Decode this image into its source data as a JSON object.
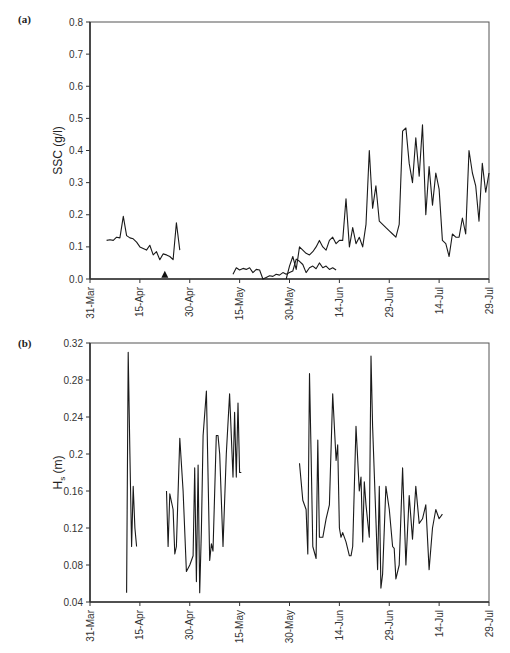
{
  "chart_data": [
    {
      "panel": "(a)",
      "type": "line",
      "title": "",
      "xlabel": "",
      "ylabel": "SSC (g/l)",
      "ylim": [
        0.0,
        0.8
      ],
      "yticks": [
        "0.0",
        "0.1",
        "0.2",
        "0.3",
        "0.4",
        "0.5",
        "0.6",
        "0.7",
        "0.8"
      ],
      "xticks": [
        "31-Mar",
        "15-Apr",
        "30-Apr",
        "15-May",
        "30-May",
        "14-Jun",
        "29-Jun",
        "14-Jul",
        "29-Jul"
      ],
      "x_unit": "days since 31-Mar",
      "xlim": [
        0,
        120
      ],
      "grid": false,
      "legend": null,
      "annotations": [
        {
          "type": "triangle-marker",
          "x": 22.5,
          "y": 0.01
        }
      ],
      "series": [
        {
          "name": "SSC",
          "segments": [
            [
              [
                5,
                0.12
              ],
              [
                6,
                0.122
              ],
              [
                7,
                0.12
              ],
              [
                8,
                0.13
              ],
              [
                9,
                0.128
              ],
              [
                10,
                0.195
              ],
              [
                11,
                0.135
              ],
              [
                12,
                0.128
              ],
              [
                13,
                0.125
              ],
              [
                14,
                0.115
              ],
              [
                15,
                0.1
              ],
              [
                16,
                0.095
              ],
              [
                17,
                0.09
              ],
              [
                18,
                0.105
              ],
              [
                19,
                0.075
              ],
              [
                20,
                0.085
              ],
              [
                21,
                0.06
              ],
              [
                22,
                0.078
              ],
              [
                23,
                0.075
              ],
              [
                24,
                0.07
              ],
              [
                25,
                0.06
              ],
              [
                26,
                0.175
              ],
              [
                27,
                0.09
              ]
            ],
            [
              [
                43,
                0.015
              ],
              [
                44,
                0.035
              ],
              [
                45,
                0.028
              ],
              [
                46,
                0.033
              ],
              [
                47,
                0.03
              ],
              [
                48,
                0.035
              ],
              [
                49,
                0.02
              ],
              [
                50,
                0.03
              ],
              [
                51,
                0.028
              ],
              [
                52,
                0.0
              ],
              [
                53,
                0.005
              ],
              [
                54,
                0.01
              ],
              [
                55,
                0.008
              ],
              [
                56,
                0.015
              ],
              [
                57,
                0.012
              ],
              [
                58,
                0.02
              ],
              [
                59,
                0.015
              ],
              [
                60,
                0.02
              ],
              [
                61,
                0.025
              ],
              [
                62,
                0.062
              ],
              [
                63,
                0.055
              ],
              [
                64,
                0.045
              ],
              [
                65,
                0.02
              ],
              [
                66,
                0.035
              ],
              [
                67,
                0.04
              ],
              [
                68,
                0.032
              ],
              [
                69,
                0.05
              ],
              [
                70,
                0.035
              ],
              [
                71,
                0.04
              ],
              [
                72,
                0.03
              ],
              [
                73,
                0.035
              ],
              [
                74,
                0.028
              ]
            ],
            [
              [
                59,
                0.0
              ],
              [
                60,
                0.04
              ],
              [
                61,
                0.07
              ],
              [
                62,
                0.03
              ],
              [
                63,
                0.1
              ],
              [
                64,
                0.09
              ],
              [
                65,
                0.08
              ],
              [
                66,
                0.075
              ],
              [
                67,
                0.085
              ],
              [
                68,
                0.1
              ],
              [
                69,
                0.12
              ],
              [
                70,
                0.1
              ],
              [
                71,
                0.09
              ],
              [
                72,
                0.12
              ],
              [
                73,
                0.13
              ],
              [
                74,
                0.11
              ],
              [
                75,
                0.12
              ],
              [
                76,
                0.12
              ],
              [
                77,
                0.25
              ],
              [
                78,
                0.1
              ],
              [
                79,
                0.16
              ],
              [
                80,
                0.11
              ],
              [
                81,
                0.13
              ],
              [
                82,
                0.1
              ],
              [
                83,
                0.17
              ],
              [
                84,
                0.4
              ],
              [
                85,
                0.22
              ],
              [
                86,
                0.29
              ],
              [
                87,
                0.18
              ],
              [
                88,
                0.17
              ],
              [
                89,
                0.16
              ],
              [
                90,
                0.15
              ],
              [
                91,
                0.14
              ],
              [
                92,
                0.13
              ],
              [
                93,
                0.17
              ],
              [
                94,
                0.46
              ],
              [
                95,
                0.47
              ],
              [
                96,
                0.36
              ],
              [
                97,
                0.3
              ],
              [
                98,
                0.44
              ],
              [
                99,
                0.32
              ],
              [
                100,
                0.48
              ],
              [
                101,
                0.2
              ],
              [
                102,
                0.35
              ],
              [
                103,
                0.23
              ],
              [
                104,
                0.33
              ],
              [
                105,
                0.28
              ],
              [
                106,
                0.12
              ],
              [
                107,
                0.11
              ],
              [
                108,
                0.07
              ],
              [
                109,
                0.14
              ],
              [
                110,
                0.13
              ],
              [
                111,
                0.13
              ],
              [
                112,
                0.19
              ],
              [
                113,
                0.14
              ],
              [
                114,
                0.4
              ],
              [
                115,
                0.33
              ],
              [
                116,
                0.29
              ],
              [
                117,
                0.18
              ],
              [
                118,
                0.36
              ],
              [
                119,
                0.27
              ],
              [
                120,
                0.33
              ]
            ]
          ]
        }
      ]
    },
    {
      "panel": "(b)",
      "type": "line",
      "title": "",
      "xlabel": "",
      "ylabel": "Hs (m)",
      "ylabel_main": "H",
      "ylabel_sub": "s",
      "ylabel_unit": " (m)",
      "ylim": [
        0.04,
        0.32
      ],
      "yticks": [
        "0.04",
        "0.08",
        "0.12",
        "0.16",
        "0.2",
        "0.24",
        "0.28",
        "0.32"
      ],
      "xticks": [
        "31-Mar",
        "15-Apr",
        "30-Apr",
        "15-May",
        "30-May",
        "14-Jun",
        "29-Jun",
        "14-Jul",
        "29-Jul"
      ],
      "x_unit": "days since 31-Mar",
      "xlim": [
        0,
        120
      ],
      "grid": false,
      "legend": null,
      "series": [
        {
          "name": "Hs",
          "segments": [
            [
              [
                11,
                0.05
              ],
              [
                11.5,
                0.31
              ],
              [
                12,
                0.2
              ],
              [
                12.5,
                0.1
              ],
              [
                13,
                0.165
              ],
              [
                13.5,
                0.12
              ],
              [
                14,
                0.1
              ]
            ],
            [
              [
                23,
                0.16
              ],
              [
                23.5,
                0.1
              ],
              [
                24,
                0.157
              ],
              [
                25,
                0.14
              ],
              [
                25.5,
                0.092
              ],
              [
                26,
                0.1
              ],
              [
                27,
                0.217
              ],
              [
                28,
                0.16
              ],
              [
                29,
                0.073
              ],
              [
                30,
                0.08
              ],
              [
                31,
                0.09
              ],
              [
                31.5,
                0.185
              ],
              [
                32,
                0.062
              ],
              [
                32.5,
                0.188
              ],
              [
                33,
                0.05
              ],
              [
                33.5,
                0.118
              ],
              [
                34,
                0.22
              ],
              [
                35,
                0.268
              ],
              [
                36,
                0.085
              ],
              [
                36.5,
                0.103
              ],
              [
                37,
                0.095
              ],
              [
                38,
                0.22
              ],
              [
                38.5,
                0.22
              ],
              [
                39,
                0.2
              ],
              [
                40,
                0.1
              ],
              [
                41,
                0.2
              ],
              [
                42,
                0.265
              ],
              [
                43,
                0.175
              ],
              [
                43.5,
                0.245
              ],
              [
                44,
                0.175
              ],
              [
                44.5,
                0.255
              ],
              [
                45,
                0.18
              ],
              [
                45.5,
                0.18
              ]
            ],
            [
              [
                63,
                0.19
              ],
              [
                64,
                0.15
              ],
              [
                65,
                0.14
              ],
              [
                65.5,
                0.092
              ],
              [
                66,
                0.287
              ],
              [
                66.5,
                0.2
              ],
              [
                67,
                0.1
              ],
              [
                68,
                0.087
              ],
              [
                68.5,
                0.215
              ],
              [
                69,
                0.11
              ],
              [
                70,
                0.11
              ],
              [
                71,
                0.13
              ],
              [
                72,
                0.145
              ],
              [
                73,
                0.265
              ],
              [
                74,
                0.193
              ],
              [
                74.5,
                0.21
              ],
              [
                75,
                0.12
              ],
              [
                75.5,
                0.11
              ],
              [
                76,
                0.115
              ],
              [
                77,
                0.105
              ],
              [
                78,
                0.09
              ],
              [
                78.5,
                0.09
              ],
              [
                79,
                0.1
              ],
              [
                80,
                0.23
              ],
              [
                81,
                0.16
              ],
              [
                81.5,
                0.175
              ],
              [
                82,
                0.105
              ],
              [
                82.5,
                0.17
              ],
              [
                83,
                0.145
              ],
              [
                84,
                0.11
              ],
              [
                84.5,
                0.306
              ],
              [
                85,
                0.23
              ],
              [
                86,
                0.13
              ],
              [
                86.5,
                0.075
              ],
              [
                87,
                0.165
              ],
              [
                87.5,
                0.055
              ],
              [
                88,
                0.07
              ],
              [
                89,
                0.165
              ],
              [
                90,
                0.14
              ],
              [
                91,
                0.1
              ],
              [
                91.5,
                0.098
              ],
              [
                92,
                0.065
              ],
              [
                93,
                0.08
              ],
              [
                94,
                0.185
              ],
              [
                95,
                0.08
              ],
              [
                96,
                0.155
              ],
              [
                97,
                0.108
              ],
              [
                98,
                0.165
              ],
              [
                99,
                0.125
              ],
              [
                100,
                0.13
              ],
              [
                101,
                0.145
              ],
              [
                102,
                0.075
              ],
              [
                103,
                0.12
              ],
              [
                104,
                0.14
              ],
              [
                105,
                0.13
              ],
              [
                106,
                0.135
              ]
            ]
          ]
        }
      ]
    }
  ],
  "panels": {
    "a": {
      "label": "(a)",
      "ylabel": "SSC (g/l)"
    },
    "b": {
      "label": "(b)",
      "ylabel_main": "H",
      "ylabel_sub": "s",
      "ylabel_unit": " (m)"
    }
  }
}
